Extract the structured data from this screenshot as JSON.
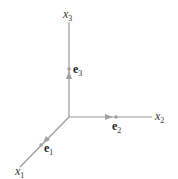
{
  "diagram": {
    "type": "3d-coordinate-axes",
    "origin": [
      69,
      117
    ],
    "axes": [
      {
        "name": "x1",
        "label": "x",
        "subscript": "1",
        "end": [
          20,
          167
        ]
      },
      {
        "name": "x2",
        "label": "x",
        "subscript": "2",
        "end": [
          152,
          117
        ]
      },
      {
        "name": "x3",
        "label": "x",
        "subscript": "3",
        "end": [
          69,
          22
        ]
      }
    ],
    "basis_vectors": [
      {
        "name": "e1",
        "label": "e",
        "subscript": "1",
        "tip": [
          41,
          145
        ]
      },
      {
        "name": "e2",
        "label": "e",
        "subscript": "2",
        "tip": [
          116,
          117
        ]
      },
      {
        "name": "e3",
        "label": "e",
        "subscript": "3",
        "tip": [
          69,
          69
        ]
      }
    ],
    "colors": {
      "axis": "#9a9a9a",
      "text": "#333333"
    }
  }
}
